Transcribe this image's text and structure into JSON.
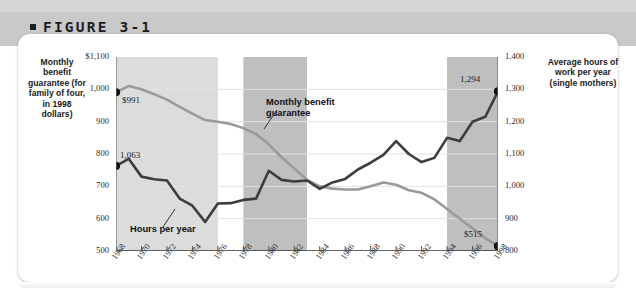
{
  "figure": {
    "label": "FIGURE 3-1"
  },
  "axis_captions": {
    "left": "Monthly benefit guarantee (for family of four, in 1998 dollars)",
    "right": "Average hours of work per year (single mothers)"
  },
  "annotations": {
    "benefit": "Monthly benefit guarantee",
    "hours": "Hours per year"
  },
  "point_labels": {
    "benefit_start": "$991",
    "benefit_end": "$515",
    "hours_start": "1,063",
    "hours_end": "1,294"
  },
  "colors": {
    "benefit_line": "#9a9a9a",
    "hours_line": "#3d3d3d",
    "band_light": "#dcdcdc",
    "band_dark": "#bfbfbf",
    "header_band": "#c9c9c9",
    "grid": "#e2e2e2",
    "axis": "#6b6b6b",
    "text": "#1b1b1b"
  },
  "chart_data": {
    "type": "line",
    "title": "FIGURE 3-1",
    "xlabel": "",
    "ylabel": "Monthly benefit guarantee (for family of four, in 1998 dollars)",
    "y2label": "Average hours of work per year (single mothers)",
    "grid": true,
    "legend": "inline-annotations",
    "xlim": [
      1968,
      1998
    ],
    "ylim": [
      500,
      1100
    ],
    "y2lim": [
      800,
      1400
    ],
    "ytick_labels": [
      "$1,100",
      "1,000",
      "900",
      "800",
      "700",
      "600",
      "500"
    ],
    "ytick_values": [
      1100,
      1000,
      900,
      800,
      700,
      600,
      500
    ],
    "y2tick_labels": [
      "1,400",
      "1,300",
      "1,200",
      "1,100",
      "1,000",
      "900",
      "800"
    ],
    "y2tick_values": [
      1400,
      1300,
      1200,
      1100,
      1000,
      900,
      800
    ],
    "xtick_labels": [
      "1968",
      "1970",
      "1972",
      "1974",
      "1976",
      "1978",
      "1980",
      "1982",
      "1984",
      "1986",
      "1988",
      "1990",
      "1992",
      "1994",
      "1996",
      "1998"
    ],
    "xtick_values": [
      1968,
      1970,
      1972,
      1974,
      1976,
      1978,
      1980,
      1982,
      1984,
      1986,
      1988,
      1990,
      1992,
      1994,
      1996,
      1998
    ],
    "x": [
      1968,
      1969,
      1970,
      1971,
      1972,
      1973,
      1974,
      1975,
      1976,
      1977,
      1978,
      1979,
      1980,
      1981,
      1982,
      1983,
      1984,
      1985,
      1986,
      1987,
      1988,
      1989,
      1990,
      1991,
      1992,
      1993,
      1994,
      1995,
      1996,
      1997,
      1998
    ],
    "series": [
      {
        "name": "Monthly benefit guarantee",
        "axis": "left",
        "color": "#9a9a9a",
        "unit": "1998 dollars",
        "values": [
          991,
          1010,
          1000,
          985,
          968,
          946,
          925,
          905,
          900,
          893,
          880,
          862,
          830,
          790,
          755,
          720,
          700,
          693,
          690,
          690,
          700,
          712,
          705,
          688,
          680,
          660,
          630,
          600,
          570,
          540,
          515
        ]
      },
      {
        "name": "Average hours of work per year (single mothers)",
        "axis": "right",
        "color": "#3d3d3d",
        "unit": "hours per year",
        "values": [
          1063,
          1085,
          1030,
          1022,
          1018,
          962,
          940,
          890,
          947,
          948,
          958,
          962,
          1048,
          1020,
          1015,
          1018,
          992,
          1012,
          1023,
          1052,
          1073,
          1097,
          1140,
          1100,
          1075,
          1088,
          1150,
          1140,
          1200,
          1215,
          1294
        ]
      }
    ],
    "shaded_bands": [
      {
        "from": 1968,
        "to": 1976,
        "shade": "light"
      },
      {
        "from": 1978,
        "to": 1983,
        "shade": "dark"
      },
      {
        "from": 1994,
        "to": 1998,
        "shade": "dark"
      }
    ],
    "endpoint_markers": [
      {
        "series": "Monthly benefit guarantee",
        "x": 1968,
        "value": 991,
        "label": "$991"
      },
      {
        "series": "Monthly benefit guarantee",
        "x": 1998,
        "value": 515,
        "label": "$515"
      },
      {
        "series": "Average hours of work per year (single mothers)",
        "x": 1968,
        "value": 1063,
        "label": "1,063"
      },
      {
        "series": "Average hours of work per year (single mothers)",
        "x": 1998,
        "value": 1294,
        "label": "1,294"
      }
    ]
  }
}
